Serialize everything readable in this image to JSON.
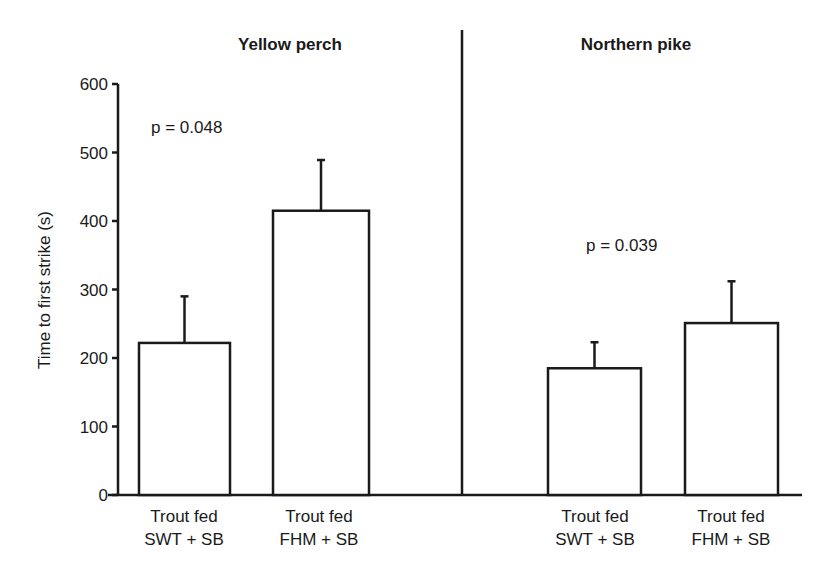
{
  "chart_data": {
    "type": "bar",
    "title": "",
    "ylabel": "Time to first strike (s)",
    "xlabel": "",
    "ylim": [
      0,
      600
    ],
    "yticks": [
      0,
      100,
      200,
      300,
      400,
      500,
      600
    ],
    "grid": false,
    "panels": [
      {
        "title": "Yellow perch",
        "annotation": "p = 0.048",
        "categories": [
          "Trout fed SWT + SB",
          "Trout fed FHM + SB"
        ],
        "values": [
          222,
          415
        ],
        "error_upper": [
          290,
          489
        ]
      },
      {
        "title": "Northern pike",
        "annotation": "p = 0.039",
        "categories": [
          "Trout fed SWT + SB",
          "Trout fed FHM + SB"
        ],
        "values": [
          185,
          251
        ],
        "error_upper": [
          223,
          312
        ]
      }
    ]
  },
  "labels": {
    "ylabel": "Time to first strike (s)",
    "yticks": [
      "0",
      "100",
      "200",
      "300",
      "400",
      "500",
      "600"
    ],
    "panel1_title": "Yellow perch",
    "panel2_title": "Northern pike",
    "panel1_p": "p = 0.048",
    "panel2_p": "p = 0.039",
    "bars": [
      {
        "line1": "Trout fed",
        "line2": "SWT + SB"
      },
      {
        "line1": "Trout fed",
        "line2": "FHM + SB"
      },
      {
        "line1": "Trout fed",
        "line2": "SWT + SB"
      },
      {
        "line1": "Trout fed",
        "line2": "FHM + SB"
      }
    ]
  }
}
